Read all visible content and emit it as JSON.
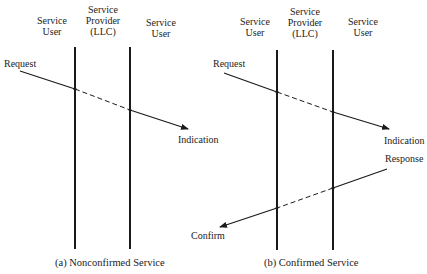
{
  "panels": [
    {
      "id": "a",
      "caption": "(a) Nonconfirmed Service",
      "columns": [
        {
          "line1": "Service",
          "line2": "User"
        },
        {
          "line1": "Service",
          "line2": "Provider",
          "line3": "(LLC)"
        },
        {
          "line1": "Service",
          "line2": "User"
        }
      ],
      "events": {
        "request": "Request",
        "indication": "Indication"
      }
    },
    {
      "id": "b",
      "caption": "(b) Confirmed Service",
      "columns": [
        {
          "line1": "Service",
          "line2": "User"
        },
        {
          "line1": "Service",
          "line2": "Provider",
          "line3": "(LLC)"
        },
        {
          "line1": "Service",
          "line2": "User"
        }
      ],
      "events": {
        "request": "Request",
        "indication": "Indication",
        "response": "Response",
        "confirm": "Confirm"
      }
    }
  ],
  "colors": {
    "line": "#1a1a1a",
    "background": "#ffffff"
  }
}
